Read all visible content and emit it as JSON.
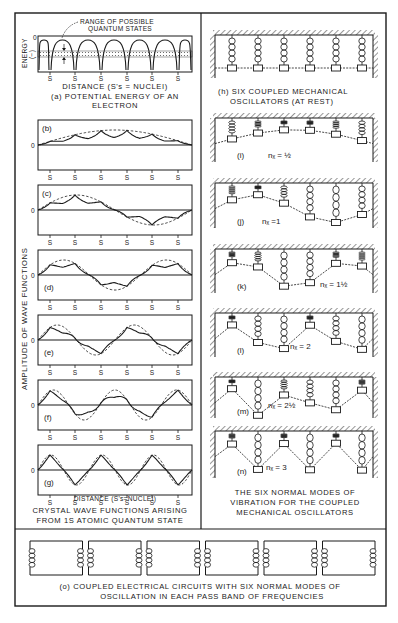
{
  "figure": {
    "ink_color": "#1a1a1a",
    "background": "#ffffff"
  },
  "panel_a": {
    "label": "(a) POTENTIAL ENERGY OF AN",
    "label_line2": "ELECTRON",
    "annotation_line1": "RANGE OF POSSIBLE",
    "annotation_line2": "QUANTUM STATES",
    "y_axis_label": "ENERGY",
    "y_axis_sub": "(−)",
    "zero_label": "0",
    "x_axis_label": "DISTANCE (S's = NUCLEI)",
    "nucleus_label": "S",
    "nuclei_count": 6
  },
  "wave_panels": {
    "y_axis_label": "AMPLITUDE OF WAVE FUNCTIONS",
    "zero_label": "0",
    "nucleus_label": "S",
    "x_axis_label": "DISTANCE (S's=NUCLEI)",
    "caption_line1": "CRYSTAL WAVE FUNCTIONS ARISING",
    "caption_line2": "FROM 1S ATOMIC QUANTUM STATE",
    "panels": [
      {
        "id": "b",
        "label": "(b)",
        "half_waves": 1
      },
      {
        "id": "c",
        "label": "(c)",
        "half_waves": 2
      },
      {
        "id": "d",
        "label": "(d)",
        "half_waves": 3
      },
      {
        "id": "e",
        "label": "(e)",
        "half_waves": 4
      },
      {
        "id": "f",
        "label": "(f)",
        "half_waves": 5
      },
      {
        "id": "g",
        "label": "(g)",
        "half_waves": 6
      }
    ]
  },
  "oscillators": {
    "rest_label_line1": "(h) SIX COUPLED MECHANICAL",
    "rest_label_line2": "OSCILLATORS (AT REST)",
    "mass_count": 6,
    "modes": [
      {
        "id": "i",
        "label": "(i)",
        "nx": "nₓ = ½",
        "half_waves": 1
      },
      {
        "id": "j",
        "label": "(j)",
        "nx": "nₓ =1",
        "half_waves": 2
      },
      {
        "id": "k",
        "label": "(k)",
        "nx": "nₓ = 1½",
        "half_waves": 3
      },
      {
        "id": "l",
        "label": "(l)",
        "nx": "nₓ = 2",
        "half_waves": 4
      },
      {
        "id": "m",
        "label": "(m)",
        "nx": "nₓ = 2½",
        "half_waves": 5
      },
      {
        "id": "n",
        "label": "(n)",
        "nx": "nₓ = 3",
        "half_waves": 6
      }
    ],
    "caption_line1": "THE SIX NORMAL MODES OF",
    "caption_line2": "VIBRATION FOR THE COUPLED",
    "caption_line3": "MECHANICAL OSCILLATORS"
  },
  "circuits": {
    "count": 6,
    "caption_line1": "(o) COUPLED ELECTRICAL CIRCUITS WITH SIX NORMAL MODES OF",
    "caption_line2": "OSCILLATION IN EACH PASS BAND OF FREQUENCIES"
  }
}
